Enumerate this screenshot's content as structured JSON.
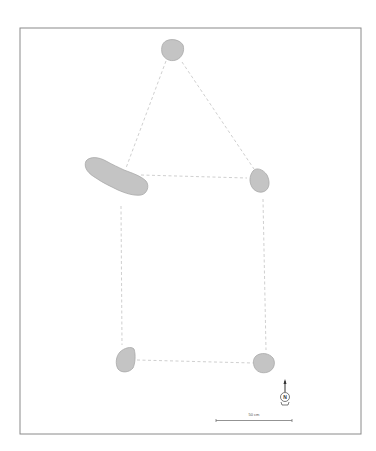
{
  "figure": {
    "type": "archaeological-plan",
    "frame": {
      "x": 20,
      "y": 28,
      "width": 341,
      "height": 406,
      "stroke": "#8a8a8a"
    },
    "stone_fill": "#c4c4c4",
    "stone_stroke": "#a8a8a8",
    "dashed_line_color": "#c9c9c9",
    "stones": [
      {
        "id": "stone-top",
        "label": "Top stone"
      },
      {
        "id": "stone-left-elongated",
        "label": "Elongated left stone"
      },
      {
        "id": "stone-right-middle",
        "label": "Right middle stone"
      },
      {
        "id": "stone-bottom-left",
        "label": "Bottom left stone"
      },
      {
        "id": "stone-bottom-right",
        "label": "Bottom right stone"
      }
    ],
    "north_arrow": {
      "label": "N"
    },
    "scale_bar": {
      "label": "50 cm"
    }
  }
}
